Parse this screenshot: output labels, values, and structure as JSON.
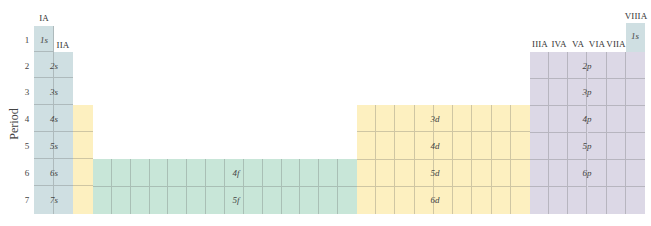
{
  "diagram": {
    "axis_label": "Period",
    "periods": [
      "1",
      "2",
      "3",
      "4",
      "5",
      "6",
      "7"
    ],
    "group_labels": {
      "IA": "IA",
      "IIA": "IIA",
      "IIIA": "IIIA",
      "IVA": "IVA",
      "VA": "VA",
      "VIA": "VIA",
      "VIIA": "VIIA",
      "VIIIA": "VIIIA"
    },
    "blocks": {
      "s": {
        "color": "#cfdfe2",
        "labels": [
          "1s",
          "2s",
          "3s",
          "4s",
          "5s",
          "6s",
          "7s"
        ],
        "helium_label": "1s"
      },
      "d": {
        "color": "#fdf0c0",
        "labels": [
          "3d",
          "4d",
          "5d",
          "6d"
        ]
      },
      "f": {
        "color": "#c8e6d8",
        "labels": [
          "4f",
          "5f"
        ]
      },
      "p": {
        "color": "#dcd8e6",
        "labels": [
          "2p",
          "3p",
          "4p",
          "5p",
          "6p"
        ]
      }
    }
  }
}
